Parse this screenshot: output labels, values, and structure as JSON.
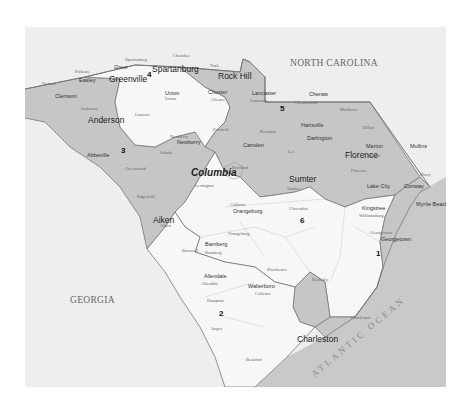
{
  "map": {
    "title": "South Carolina Congressional Districts",
    "colors": {
      "page_bg": "#ffffff",
      "frame_bg": "#eeeeee",
      "shaded_district": "#c6c6c6",
      "unshaded_district": "#f7f7f7",
      "ocean": "#c9c9c9",
      "border": "#777777"
    },
    "neighbors": {
      "north": "NORTH CAROLINA",
      "west": "GEORGIA",
      "ocean": "ATLANTIC OCEAN"
    },
    "districts": [
      {
        "number": "1",
        "shaded": true
      },
      {
        "number": "2",
        "shaded": false
      },
      {
        "number": "3",
        "shaded": true
      },
      {
        "number": "4",
        "shaded": false
      },
      {
        "number": "5",
        "shaded": true
      },
      {
        "number": "6",
        "shaded": false
      }
    ],
    "major_cities": [
      "Greenville",
      "Spartanburg",
      "Rock Hill",
      "Anderson",
      "Columbia",
      "Florence",
      "Sumter",
      "Aiken",
      "Charleston"
    ],
    "towns": [
      "Greer",
      "Easley",
      "Clemson",
      "Union",
      "Chester",
      "Lancaster",
      "Cheraw",
      "Newberry",
      "Abbeville",
      "Camden",
      "Hartsville",
      "Darlington",
      "Marion",
      "Mullins",
      "Lake City",
      "Conway",
      "Myrtle Beach",
      "Kingstree",
      "Georgetown",
      "Orangeburg",
      "Bamberg",
      "Allendale",
      "Walterboro"
    ],
    "counties": [
      "Oconee",
      "Pickens",
      "Greenville",
      "Spartanburg",
      "Cherokee",
      "York",
      "Anderson",
      "Laurens",
      "Union",
      "Chester",
      "Lancaster",
      "Chesterfield",
      "Marlboro",
      "Abbeville",
      "Greenwood",
      "Newberry",
      "Fairfield",
      "Kershaw",
      "Lee",
      "Darlington",
      "Dillon",
      "Marion",
      "Horry",
      "McCormick",
      "Saluda",
      "Edgefield",
      "Lexington",
      "Richland",
      "Sumter",
      "Florence",
      "Williamsburg",
      "Aiken",
      "Calhoun",
      "Clarendon",
      "Georgetown",
      "Barnwell",
      "Bamberg",
      "Orangeburg",
      "Allendale",
      "Hampton",
      "Colleton",
      "Dorchester",
      "Berkeley",
      "Charleston",
      "Jasper",
      "Beaufort"
    ]
  }
}
